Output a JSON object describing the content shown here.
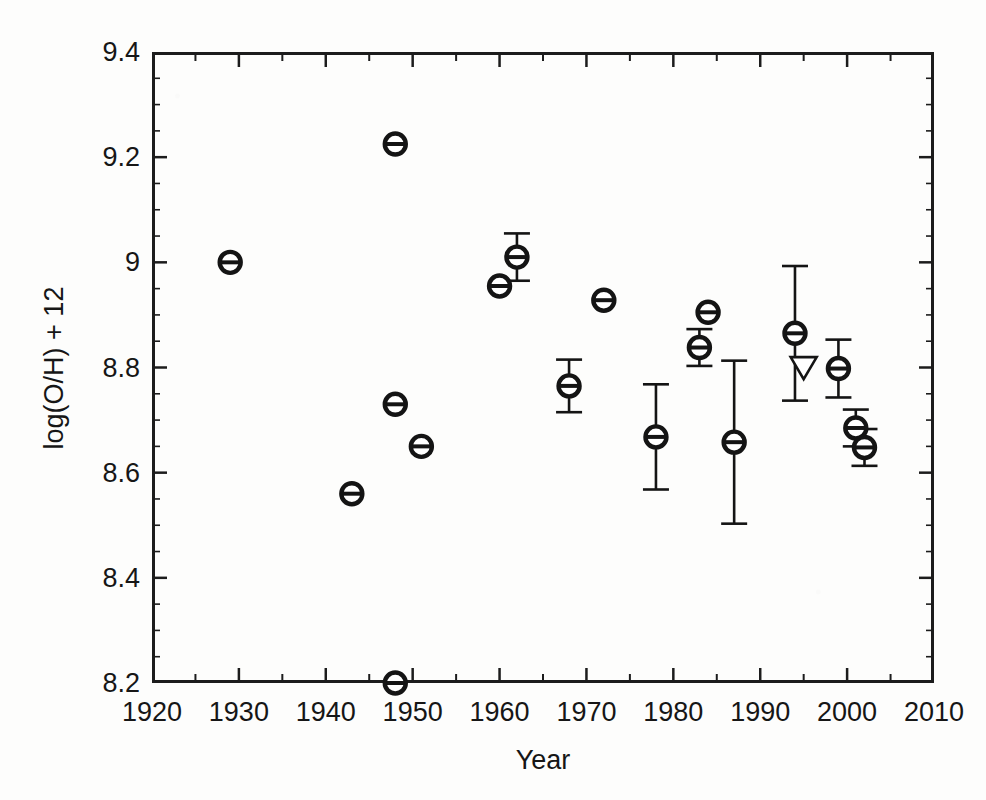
{
  "chart_data": {
    "type": "scatter",
    "title": "",
    "xlabel": "Year",
    "ylabel": "log(O/H) + 12",
    "xlim": [
      1920,
      2010
    ],
    "ylim": [
      8.2,
      9.4
    ],
    "grid": false,
    "legend": null,
    "xticks": [
      1920,
      1930,
      1940,
      1950,
      1960,
      1970,
      1980,
      1990,
      2000,
      2010
    ],
    "xtick_labels": [
      "1920",
      "1930",
      "1940",
      "1950",
      "1960",
      "1970",
      "1980",
      "1990",
      "2000",
      "2010"
    ],
    "xminor_interval": 5,
    "yticks": [
      8.2,
      8.4,
      8.6,
      8.8,
      9.0,
      9.2,
      9.4
    ],
    "ytick_labels": [
      "8.2",
      "8.4",
      "8.6",
      "8.8",
      "9",
      "9.2",
      "9.4"
    ],
    "yminor_interval": 0.05,
    "marker_style": "open-circle-with-bar",
    "marker_color": "#141414",
    "points": [
      {
        "x": 1929,
        "y": 9.0,
        "yerr": 0,
        "marker": "circle"
      },
      {
        "x": 1943,
        "y": 8.56,
        "yerr": 0,
        "marker": "circle"
      },
      {
        "x": 1948,
        "y": 9.225,
        "yerr": 0,
        "marker": "circle"
      },
      {
        "x": 1948,
        "y": 8.73,
        "yerr": 0,
        "marker": "circle"
      },
      {
        "x": 1948,
        "y": 8.2,
        "yerr": 0,
        "marker": "circle"
      },
      {
        "x": 1951,
        "y": 8.65,
        "yerr": 0,
        "marker": "circle"
      },
      {
        "x": 1960,
        "y": 8.955,
        "yerr": 0,
        "marker": "circle"
      },
      {
        "x": 1962,
        "y": 9.01,
        "yerr": 0.045,
        "marker": "circle"
      },
      {
        "x": 1968,
        "y": 8.765,
        "yerr": 0.05,
        "marker": "circle"
      },
      {
        "x": 1972,
        "y": 8.928,
        "yerr": 0,
        "marker": "circle"
      },
      {
        "x": 1978,
        "y": 8.668,
        "yerr": 0.1,
        "marker": "circle"
      },
      {
        "x": 1983,
        "y": 8.838,
        "yerr": 0.035,
        "marker": "circle"
      },
      {
        "x": 1984,
        "y": 8.905,
        "yerr": 0,
        "marker": "circle"
      },
      {
        "x": 1987,
        "y": 8.658,
        "yerr": 0.155,
        "marker": "circle"
      },
      {
        "x": 1994,
        "y": 8.865,
        "yerr": 0.128,
        "marker": "circle"
      },
      {
        "x": 1995,
        "y": 8.8,
        "yerr": 0,
        "marker": "triangle-down-open"
      },
      {
        "x": 1999,
        "y": 8.798,
        "yerr": 0.055,
        "marker": "circle"
      },
      {
        "x": 2001,
        "y": 8.685,
        "yerr": 0.035,
        "marker": "circle"
      },
      {
        "x": 2002,
        "y": 8.648,
        "yerr": 0.035,
        "marker": "circle"
      }
    ]
  },
  "axes": {
    "x_title": "Year",
    "y_title": "log(O/H) + 12"
  },
  "colors": {
    "ink": "#141414",
    "frame": "#1c1c1c",
    "background": "#fdfdfc"
  }
}
